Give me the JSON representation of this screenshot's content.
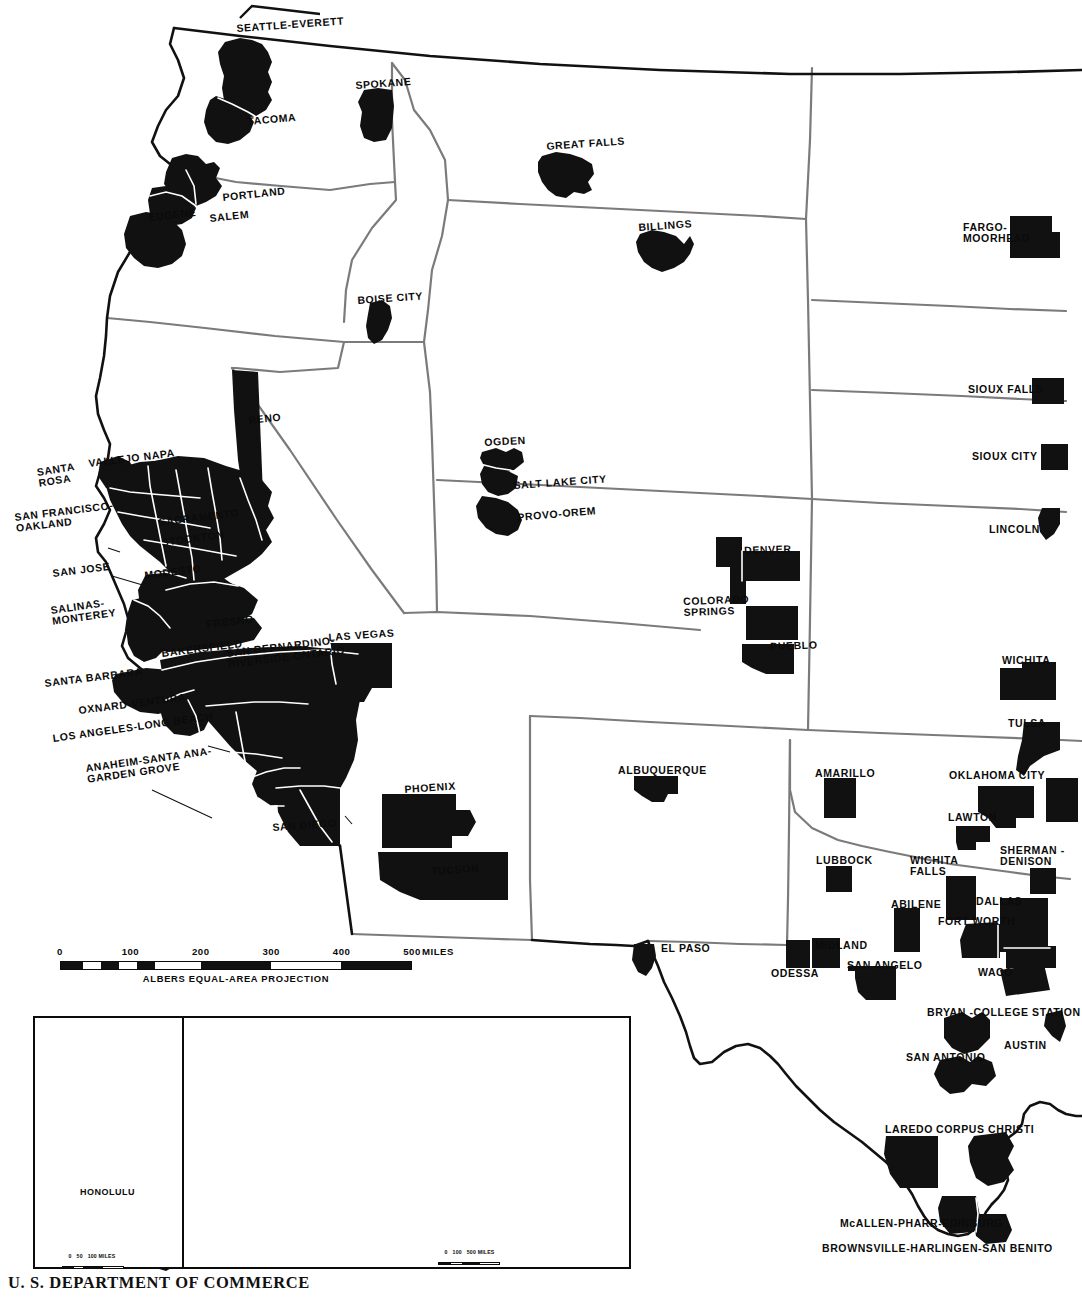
{
  "document": {
    "agency": "U. S. DEPARTMENT OF COMMERCE",
    "projection_note": "ALBERS EQUAL-AREA PROJECTION"
  },
  "scale_bar": {
    "unit": "MILES",
    "ticks": [
      "0",
      "100",
      "200",
      "300",
      "400",
      "500"
    ],
    "max_miles": 500
  },
  "insets": {
    "hawaii": {
      "city_label": "HONOLULU",
      "scale_ticks": [
        "0",
        "50",
        "100"
      ],
      "scale_unit": "MILES"
    },
    "alaska": {
      "scale_ticks": [
        "0",
        "100",
        "500"
      ],
      "scale_unit": "MILES"
    }
  },
  "chart_data": {
    "type": "map",
    "projection": "Albers Equal-Area",
    "legend_position": "none",
    "colors": {
      "metro_fill": "#111111",
      "state_border": "#6e6e6e",
      "coast_border": "#111111",
      "background": "#ffffff"
    }
  },
  "metro_labels": [
    {
      "id": "seattle-everett",
      "text": "SEATTLE-EVERETT",
      "x": 236,
      "y": 23,
      "rot": -4,
      "size": "normal",
      "align": "left"
    },
    {
      "id": "tacoma",
      "text": "TACOMA",
      "x": 247,
      "y": 116,
      "rot": -5,
      "size": "normal",
      "align": "left"
    },
    {
      "id": "spokane",
      "text": "SPOKANE",
      "x": 355,
      "y": 80,
      "rot": -4,
      "size": "normal",
      "align": "left"
    },
    {
      "id": "portland",
      "text": "PORTLAND",
      "x": 222,
      "y": 192,
      "rot": -6,
      "size": "normal",
      "align": "left"
    },
    {
      "id": "salem",
      "text": "SALEM",
      "x": 209,
      "y": 213,
      "rot": -6,
      "size": "normal",
      "align": "left"
    },
    {
      "id": "eugene",
      "text": "EUGENE",
      "x": 148,
      "y": 212,
      "rot": -6,
      "size": "normal",
      "align": "left"
    },
    {
      "id": "boise-city",
      "text": "BOISE CITY",
      "x": 357,
      "y": 295,
      "rot": -4,
      "size": "normal",
      "align": "left"
    },
    {
      "id": "great-falls",
      "text": "GREAT FALLS",
      "x": 546,
      "y": 141,
      "rot": -4,
      "size": "normal",
      "align": "left"
    },
    {
      "id": "billings",
      "text": "BILLINGS",
      "x": 638,
      "y": 222,
      "rot": -4,
      "size": "normal",
      "align": "left"
    },
    {
      "id": "fargo-moorhead",
      "text": "FARGO-\nMOORHEAD",
      "x": 963,
      "y": 222,
      "rot": 0,
      "size": "normal",
      "align": "left"
    },
    {
      "id": "sioux-falls",
      "text": "SIOUX FALLS",
      "x": 968,
      "y": 384,
      "rot": 0,
      "size": "normal",
      "align": "left"
    },
    {
      "id": "sioux-city",
      "text": "SIOUX CITY",
      "x": 972,
      "y": 451,
      "rot": 0,
      "size": "normal",
      "align": "left"
    },
    {
      "id": "lincoln",
      "text": "LINCOLN",
      "x": 989,
      "y": 524,
      "rot": 0,
      "size": "normal",
      "align": "left"
    },
    {
      "id": "reno",
      "text": "RENO",
      "x": 248,
      "y": 415,
      "rot": -6,
      "size": "normal",
      "align": "left"
    },
    {
      "id": "ogden",
      "text": "OGDEN",
      "x": 484,
      "y": 437,
      "rot": -3,
      "size": "normal",
      "align": "left"
    },
    {
      "id": "salt-lake-city",
      "text": "SALT LAKE CITY",
      "x": 513,
      "y": 480,
      "rot": -4,
      "size": "normal",
      "align": "left"
    },
    {
      "id": "provo-orem",
      "text": "PROVO-OREM",
      "x": 517,
      "y": 512,
      "rot": -5,
      "size": "normal",
      "align": "left"
    },
    {
      "id": "denver",
      "text": "DENVER",
      "x": 744,
      "y": 545,
      "rot": -2,
      "size": "normal",
      "align": "left"
    },
    {
      "id": "colorado-springs",
      "text": "COLORADO\nSPRINGS",
      "x": 683,
      "y": 596,
      "rot": -2,
      "size": "normal",
      "align": "left"
    },
    {
      "id": "pueblo",
      "text": "PUEBLO",
      "x": 770,
      "y": 641,
      "rot": -2,
      "size": "normal",
      "align": "left"
    },
    {
      "id": "wichita",
      "text": "WICHITA",
      "x": 1002,
      "y": 655,
      "rot": 0,
      "size": "normal",
      "align": "left"
    },
    {
      "id": "tulsa",
      "text": "TULSA",
      "x": 1008,
      "y": 718,
      "rot": 0,
      "size": "normal",
      "align": "left"
    },
    {
      "id": "oklahoma-city",
      "text": "OKLAHOMA CITY",
      "x": 949,
      "y": 770,
      "rot": 0,
      "size": "normal",
      "align": "left"
    },
    {
      "id": "lawton",
      "text": "LAWTON",
      "x": 948,
      "y": 812,
      "rot": 0,
      "size": "normal",
      "align": "left"
    },
    {
      "id": "wichita-falls",
      "text": "WICHITA\nFALLS",
      "x": 910,
      "y": 855,
      "rot": 0,
      "size": "normal",
      "align": "left"
    },
    {
      "id": "sherman-denison",
      "text": "SHERMAN -\nDENISON",
      "x": 1000,
      "y": 845,
      "rot": 0,
      "size": "normal",
      "align": "left"
    },
    {
      "id": "dallas",
      "text": "DALLAS",
      "x": 976,
      "y": 896,
      "rot": 0,
      "size": "normal",
      "align": "left"
    },
    {
      "id": "fort-worth",
      "text": "FORT WORTH",
      "x": 938,
      "y": 916,
      "rot": 0,
      "size": "normal",
      "align": "left"
    },
    {
      "id": "abilene",
      "text": "ABILENE",
      "x": 891,
      "y": 899,
      "rot": 0,
      "size": "normal",
      "align": "left"
    },
    {
      "id": "waco",
      "text": "WACO",
      "x": 978,
      "y": 967,
      "rot": 0,
      "size": "normal",
      "align": "left"
    },
    {
      "id": "amarillo",
      "text": "AMARILLO",
      "x": 815,
      "y": 768,
      "rot": 0,
      "size": "normal",
      "align": "left"
    },
    {
      "id": "lubbock",
      "text": "LUBBOCK",
      "x": 816,
      "y": 855,
      "rot": 0,
      "size": "normal",
      "align": "left"
    },
    {
      "id": "midland",
      "text": "MIDLAND",
      "x": 815,
      "y": 940,
      "rot": 0,
      "size": "normal",
      "align": "left"
    },
    {
      "id": "odessa",
      "text": "ODESSA",
      "x": 771,
      "y": 968,
      "rot": 0,
      "size": "normal",
      "align": "left"
    },
    {
      "id": "san-angelo",
      "text": "SAN ANGELO",
      "x": 847,
      "y": 960,
      "rot": 0,
      "size": "normal",
      "align": "left"
    },
    {
      "id": "el-paso",
      "text": "EL PASO",
      "x": 661,
      "y": 943,
      "rot": 0,
      "size": "normal",
      "align": "left"
    },
    {
      "id": "albuquerque",
      "text": "ALBUQUERQUE",
      "x": 618,
      "y": 765,
      "rot": 0,
      "size": "normal",
      "align": "left"
    },
    {
      "id": "bryan-college-station",
      "text": "BRYAN -COLLEGE STATION",
      "x": 927,
      "y": 1007,
      "rot": 0,
      "size": "normal",
      "align": "left"
    },
    {
      "id": "austin",
      "text": "AUSTIN",
      "x": 1004,
      "y": 1040,
      "rot": 0,
      "size": "normal",
      "align": "left"
    },
    {
      "id": "san-antonio",
      "text": "SAN ANTONIO",
      "x": 906,
      "y": 1052,
      "rot": 0,
      "size": "normal",
      "align": "left"
    },
    {
      "id": "laredo",
      "text": "LAREDO",
      "x": 885,
      "y": 1124,
      "rot": 0,
      "size": "normal",
      "align": "left"
    },
    {
      "id": "corpus-christi",
      "text": "CORPUS CHRISTI",
      "x": 936,
      "y": 1124,
      "rot": 0,
      "size": "normal",
      "align": "left"
    },
    {
      "id": "mcallen-pharr-edinburg",
      "text": "McALLEN-PHARR-EDINBURG",
      "x": 840,
      "y": 1218,
      "rot": 0,
      "size": "normal",
      "align": "left"
    },
    {
      "id": "brownsville-harlingen-san-benito",
      "text": "BROWNSVILLE-HARLINGEN-SAN BENITO",
      "x": 822,
      "y": 1243,
      "rot": 0,
      "size": "normal",
      "align": "left"
    },
    {
      "id": "las-vegas",
      "text": "LAS VEGAS",
      "x": 328,
      "y": 632,
      "rot": -4,
      "size": "normal",
      "align": "left"
    },
    {
      "id": "phoenix",
      "text": "PHOENIX",
      "x": 404,
      "y": 784,
      "rot": -4,
      "size": "normal",
      "align": "left"
    },
    {
      "id": "tucson",
      "text": "TUCSON",
      "x": 431,
      "y": 866,
      "rot": -4,
      "size": "normal",
      "align": "left"
    },
    {
      "id": "san-diego",
      "text": "SAN DIEGO",
      "x": 272,
      "y": 822,
      "rot": -4,
      "size": "normal",
      "align": "left"
    },
    {
      "id": "santa-rosa",
      "text": "SANTA\nROSA",
      "x": 36,
      "y": 467,
      "rot": -9,
      "size": "normal",
      "align": "left"
    },
    {
      "id": "vallejo-napa",
      "text": "VALLEJO NAPA",
      "x": 88,
      "y": 458,
      "rot": -7,
      "size": "normal",
      "align": "left"
    },
    {
      "id": "san-francisco-oakland",
      "text": "SAN FRANCISCO-\nOAKLAND",
      "x": 14,
      "y": 512,
      "rot": -7,
      "size": "normal",
      "align": "left"
    },
    {
      "id": "sacramento",
      "text": "SACRAMENTO",
      "x": 158,
      "y": 517,
      "rot": -7,
      "size": "normal",
      "align": "left"
    },
    {
      "id": "stockton",
      "text": "STOCKTON",
      "x": 161,
      "y": 537,
      "rot": -7,
      "size": "normal",
      "align": "left"
    },
    {
      "id": "san-jose",
      "text": "SAN JOSE",
      "x": 52,
      "y": 568,
      "rot": -7,
      "size": "normal",
      "align": "left"
    },
    {
      "id": "modesto",
      "text": "MODESTO",
      "x": 144,
      "y": 570,
      "rot": -7,
      "size": "normal",
      "align": "left"
    },
    {
      "id": "salinas-monterey",
      "text": "SALINAS-\nMONTEREY",
      "x": 50,
      "y": 605,
      "rot": -8,
      "size": "normal",
      "align": "left"
    },
    {
      "id": "fresno",
      "text": "FRESNO",
      "x": 206,
      "y": 619,
      "rot": -7,
      "size": "normal",
      "align": "left"
    },
    {
      "id": "bakersfield",
      "text": "BAKERSFIELD",
      "x": 161,
      "y": 648,
      "rot": -7,
      "size": "normal",
      "align": "left"
    },
    {
      "id": "san-bernardino-riverside-ontario",
      "text": "SAN BERNARDINO-\nRIVERSIDE-ONTARIO",
      "x": 226,
      "y": 648,
      "rot": -7,
      "size": "normal",
      "align": "left"
    },
    {
      "id": "santa-barbara",
      "text": "SANTA BARBARA",
      "x": 44,
      "y": 678,
      "rot": -7,
      "size": "normal",
      "align": "left"
    },
    {
      "id": "oxnard-ventura",
      "text": "OXNARD-VENTURA",
      "x": 78,
      "y": 705,
      "rot": -7,
      "size": "normal",
      "align": "left"
    },
    {
      "id": "los-angeles-long-beach",
      "text": "LOS ANGELES-LONG BEACH",
      "x": 52,
      "y": 733,
      "rot": -8,
      "size": "normal",
      "align": "left"
    },
    {
      "id": "anaheim-santa-ana-garden-grove",
      "text": "ANAHEIM-SANTA ANA-\nGARDEN GROVE",
      "x": 85,
      "y": 763,
      "rot": -8,
      "size": "normal",
      "align": "left"
    }
  ]
}
